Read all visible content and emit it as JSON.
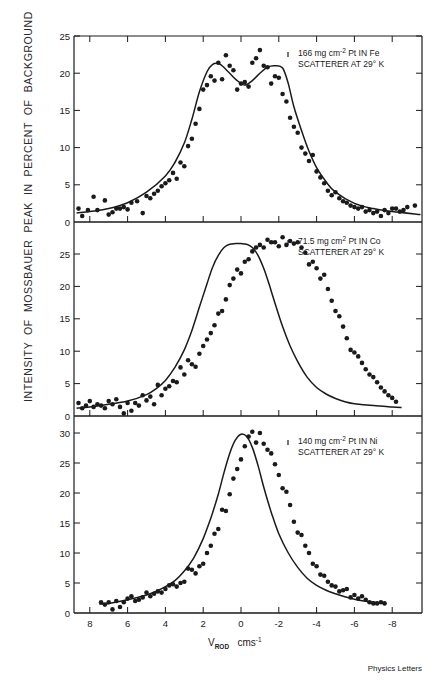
{
  "figure": {
    "ylabel": "INTENSITY  OF  MOSSBAUER  PEAK  IN  PERCENT  OF  BACKGROUND",
    "xlabel_main": "V",
    "xlabel_sub": "ROD",
    "xlabel_unit": "cms",
    "xlabel_unit_sup": "-1",
    "credit": "Physics Letters",
    "colors": {
      "ink": "#1a1a1a",
      "background": "#ffffff"
    }
  },
  "chart_data": [
    {
      "type": "scatter",
      "title": "166 mg cm-2 Pt IN Fe SCATTERER AT 29° K",
      "annotation_line1": "166  mg cm",
      "annotation_sup": "-2",
      "annotation_line1b": " Pt  IN  Fe",
      "annotation_line2": "SCATTERER  AT  29° K",
      "xlabel": "V_ROD cms^-1",
      "ylabel": "INTENSITY OF MOSSBAUER PEAK IN PERCENT OF BACKGROUND",
      "xlim": [
        8.8,
        -9.6
      ],
      "ylim": [
        0,
        25
      ],
      "yticks": [
        0,
        5,
        10,
        15,
        20,
        25
      ],
      "xticks": [
        8,
        6,
        4,
        2,
        0,
        -2,
        -4,
        -6,
        -8
      ],
      "grid": false,
      "fit_curve": {
        "x": [
          8.7,
          8,
          7,
          6,
          5,
          4,
          3.5,
          3,
          2.6,
          2.2,
          1.8,
          1.5,
          1.2,
          1.0,
          0.6,
          0.2,
          -0.2,
          -0.6,
          -1.0,
          -1.4,
          -1.8,
          -2.2,
          -2.5,
          -2.8,
          -3.2,
          -3.6,
          -4,
          -4.5,
          -5,
          -6,
          -7,
          -8,
          -9.5
        ],
        "y": [
          1.2,
          1.4,
          1.8,
          2.6,
          4.0,
          6.2,
          8.0,
          10.6,
          13.8,
          17.5,
          20.2,
          21.2,
          21.3,
          21.0,
          20.0,
          19.0,
          18.4,
          19.0,
          20.0,
          20.8,
          21.0,
          20.7,
          18.6,
          15.5,
          12.3,
          9.5,
          7.3,
          5.4,
          4.0,
          2.5,
          1.8,
          1.4,
          1.0
        ]
      },
      "series": [
        {
          "name": "measured",
          "x": [
            8.6,
            8.4,
            8.1,
            7.8,
            7.6,
            7.2,
            7.0,
            6.8,
            6.6,
            6.4,
            6.2,
            6.0,
            5.8,
            5.5,
            5.2,
            5.0,
            4.8,
            4.6,
            4.4,
            4.2,
            4.0,
            3.8,
            3.6,
            3.4,
            3.2,
            3.0,
            2.8,
            2.6,
            2.4,
            2.2,
            2.0,
            1.8,
            1.6,
            1.4,
            1.2,
            1.0,
            0.8,
            0.6,
            0.4,
            0.2,
            0.0,
            -0.2,
            -0.4,
            -0.6,
            -0.8,
            -1.0,
            -1.2,
            -1.4,
            -1.6,
            -1.8,
            -2.0,
            -2.2,
            -2.4,
            -2.6,
            -2.8,
            -3.0,
            -3.2,
            -3.4,
            -3.6,
            -3.8,
            -4.0,
            -4.2,
            -4.4,
            -4.6,
            -4.8,
            -5.0,
            -5.2,
            -5.4,
            -5.6,
            -5.8,
            -6.0,
            -6.2,
            -6.4,
            -6.6,
            -6.8,
            -7.0,
            -7.2,
            -7.4,
            -7.6,
            -7.8,
            -8.0,
            -8.2,
            -8.4,
            -8.6,
            -8.8,
            -9.2
          ],
          "y": [
            1.8,
            0.8,
            1.6,
            3.4,
            1.6,
            2.9,
            1.0,
            1.3,
            1.8,
            1.8,
            2.0,
            1.7,
            2.6,
            2.8,
            1.2,
            3.5,
            3.2,
            3.8,
            4.2,
            4.8,
            5.2,
            5.6,
            6.6,
            5.8,
            8.0,
            7.5,
            10.2,
            11.2,
            13.2,
            15.2,
            17.8,
            18.4,
            19.6,
            19.0,
            21.4,
            19.2,
            22.4,
            21.0,
            20.4,
            17.8,
            18.6,
            18.8,
            18.2,
            21.4,
            22.0,
            23.1,
            21.0,
            20.8,
            18.6,
            19.6,
            19.4,
            17.2,
            16.2,
            14.0,
            12.8,
            12.0,
            10.0,
            9.2,
            8.2,
            9.0,
            6.8,
            6.0,
            5.2,
            4.2,
            3.6,
            4.0,
            3.2,
            2.8,
            2.6,
            2.2,
            2.0,
            1.8,
            2.0,
            1.4,
            1.6,
            1.2,
            1.4,
            0.8,
            1.6,
            1.2,
            1.8,
            1.8,
            1.4,
            1.6,
            2.0,
            2.2
          ]
        }
      ]
    },
    {
      "type": "scatter",
      "title": "71.5 mg cm-2 Pt IN Co SCATTERER AT 29° K",
      "annotation_line1": "71.5  mg cm",
      "annotation_sup": "2",
      "annotation_line1b": "  Pt  IN  Co",
      "annotation_line2": "SCATTERER  AT  29° K",
      "xlim": [
        8.8,
        -9.6
      ],
      "ylim": [
        0,
        27.5
      ],
      "yticks": [
        0,
        5,
        10,
        15,
        20,
        25
      ],
      "xticks": [
        8,
        6,
        4,
        2,
        0,
        -2,
        -4,
        -6,
        -8
      ],
      "grid": false,
      "fit_curve": {
        "x": [
          8.7,
          8,
          7,
          6,
          5,
          4.5,
          4,
          3.5,
          3,
          2.6,
          2.2,
          1.8,
          1.5,
          1.2,
          0.9,
          0.6,
          0.3,
          0,
          -0.3,
          -0.6,
          -0.9,
          -1.2,
          -1.5,
          -1.8,
          -2.2,
          -2.6,
          -3,
          -3.5,
          -4,
          -4.5,
          -5,
          -5.5,
          -6,
          -7,
          -8,
          -8.5
        ],
        "y": [
          1.2,
          1.4,
          1.8,
          2.3,
          3.3,
          4.2,
          5.5,
          7.5,
          10.2,
          13.2,
          16.8,
          20.4,
          23.0,
          24.8,
          26.0,
          26.5,
          26.6,
          26.6,
          26.5,
          26.0,
          24.8,
          22.8,
          20.2,
          17.4,
          13.8,
          10.8,
          8.4,
          6.0,
          4.4,
          3.4,
          2.7,
          2.2,
          1.9,
          1.6,
          1.4,
          1.3
        ]
      },
      "series": [
        {
          "name": "measured",
          "x": [
            8.6,
            8.4,
            8.2,
            8.0,
            7.8,
            7.6,
            7.4,
            7.2,
            7.0,
            6.8,
            6.6,
            6.4,
            6.2,
            6.0,
            5.8,
            5.6,
            5.4,
            5.2,
            5.0,
            4.8,
            4.6,
            4.4,
            4.2,
            4.0,
            3.8,
            3.6,
            3.4,
            3.2,
            3.0,
            2.8,
            2.6,
            2.4,
            2.2,
            2.0,
            1.8,
            1.6,
            1.4,
            1.2,
            1.0,
            0.8,
            0.6,
            0.4,
            0.2,
            0.0,
            -0.2,
            -0.4,
            -0.6,
            -0.8,
            -1.0,
            -1.2,
            -1.4,
            -1.6,
            -1.8,
            -2.0,
            -2.2,
            -2.4,
            -2.6,
            -2.8,
            -3.0,
            -3.2,
            -3.4,
            -3.6,
            -3.8,
            -4.0,
            -4.2,
            -4.4,
            -4.6,
            -4.8,
            -5.0,
            -5.2,
            -5.4,
            -5.6,
            -5.8,
            -6.0,
            -6.2,
            -6.4,
            -6.6,
            -6.8,
            -7.0,
            -7.2,
            -7.4,
            -7.6,
            -7.8,
            -8.0,
            -8.2
          ],
          "y": [
            2.0,
            1.2,
            1.6,
            2.3,
            1.4,
            1.8,
            1.6,
            1.2,
            2.3,
            1.8,
            2.6,
            1.4,
            0.4,
            2.0,
            0.8,
            2.0,
            1.6,
            3.2,
            2.4,
            3.0,
            1.8,
            4.8,
            3.2,
            4.2,
            4.6,
            5.4,
            5.2,
            7.5,
            6.4,
            8.6,
            8.0,
            7.6,
            9.6,
            10.8,
            11.8,
            12.8,
            14.0,
            15.8,
            16.2,
            18.0,
            20.2,
            21.2,
            22.6,
            22.0,
            23.8,
            24.2,
            25.4,
            26.0,
            26.4,
            26.0,
            27.2,
            26.8,
            26.8,
            26.2,
            27.6,
            26.4,
            27.0,
            26.6,
            26.8,
            26.0,
            25.2,
            23.4,
            23.8,
            22.8,
            21.2,
            21.8,
            19.6,
            17.8,
            16.2,
            15.4,
            13.8,
            12.0,
            10.2,
            9.8,
            9.2,
            8.2,
            7.2,
            6.4,
            6.0,
            5.2,
            4.4,
            3.8,
            3.2,
            2.8,
            2.2
          ]
        }
      ]
    },
    {
      "type": "scatter",
      "title": "140 mg cm-2 Pt IN Ni SCATTERER AT 29° K",
      "annotation_line1": "140  mg cm",
      "annotation_sup": "-2",
      "annotation_line1b": "  Pt  IN  Ni",
      "annotation_line2": "SCATTERER  AT  29° K",
      "xlim": [
        8.8,
        -9.6
      ],
      "ylim": [
        0,
        30
      ],
      "yticks": [
        0,
        5,
        10,
        15,
        20,
        25,
        30
      ],
      "xticks": [
        8,
        6,
        4,
        2,
        0,
        -2,
        -4,
        -6,
        -8
      ],
      "xticklabels": [
        "8",
        "6",
        "4",
        "2",
        "0",
        "-2",
        "-4",
        "-6",
        "-8"
      ],
      "grid": false,
      "fit_curve": {
        "x": [
          7.5,
          7,
          6,
          5,
          4.5,
          4,
          3.5,
          3,
          2.5,
          2.0,
          1.6,
          1.2,
          0.9,
          0.6,
          0.3,
          0.0,
          -0.3,
          -0.6,
          -0.9,
          -1.2,
          -1.6,
          -2.0,
          -2.5,
          -3.0,
          -3.5,
          -4,
          -4.5,
          -5,
          -5.5,
          -6,
          -6.5,
          -7,
          -7.6
        ],
        "y": [
          1.5,
          1.6,
          2.2,
          3.0,
          3.6,
          4.4,
          5.4,
          7.0,
          9.2,
          12.4,
          15.8,
          19.8,
          23.4,
          26.6,
          28.8,
          29.8,
          29.4,
          27.6,
          24.6,
          21.0,
          16.8,
          13.2,
          10.0,
          7.6,
          5.8,
          4.6,
          3.8,
          3.2,
          2.7,
          2.3,
          2.0,
          1.8,
          1.6
        ]
      },
      "series": [
        {
          "name": "measured",
          "x": [
            7.4,
            7.2,
            7.0,
            6.8,
            6.6,
            6.4,
            6.2,
            6.0,
            5.8,
            5.6,
            5.4,
            5.2,
            5.0,
            4.8,
            4.6,
            4.4,
            4.2,
            4.0,
            3.8,
            3.6,
            3.4,
            3.2,
            3.0,
            2.8,
            2.6,
            2.4,
            2.2,
            2.0,
            1.8,
            1.6,
            1.4,
            1.2,
            1.0,
            0.8,
            0.6,
            0.4,
            0.2,
            0.0,
            -0.2,
            -0.4,
            -0.6,
            -0.8,
            -1.0,
            -1.2,
            -1.4,
            -1.6,
            -1.8,
            -2.0,
            -2.2,
            -2.4,
            -2.6,
            -2.8,
            -3.0,
            -3.2,
            -3.4,
            -3.6,
            -3.8,
            -4.0,
            -4.2,
            -4.4,
            -4.6,
            -4.8,
            -5.0,
            -5.2,
            -5.4,
            -5.6,
            -5.8,
            -6.0,
            -6.2,
            -6.4,
            -6.6,
            -6.8,
            -7.0,
            -7.2,
            -7.4,
            -7.6
          ],
          "y": [
            1.8,
            1.4,
            1.8,
            0.6,
            2.0,
            1.0,
            1.8,
            2.4,
            2.8,
            2.0,
            2.2,
            2.6,
            3.4,
            2.8,
            3.2,
            3.6,
            3.4,
            4.0,
            4.6,
            4.8,
            4.4,
            5.0,
            5.2,
            7.4,
            7.2,
            6.6,
            7.8,
            8.2,
            10.0,
            11.2,
            13.2,
            14.0,
            17.2,
            17.0,
            19.8,
            22.4,
            24.0,
            25.6,
            27.8,
            29.4,
            30.2,
            28.4,
            30.0,
            28.2,
            27.2,
            26.6,
            24.8,
            23.0,
            20.8,
            20.2,
            18.0,
            15.2,
            13.4,
            13.0,
            11.2,
            10.0,
            8.2,
            7.8,
            6.4,
            6.2,
            5.2,
            4.6,
            4.4,
            3.6,
            3.8,
            4.0,
            2.6,
            3.0,
            2.4,
            2.8,
            2.2,
            1.8,
            1.6,
            1.6,
            1.8,
            1.6
          ]
        }
      ]
    }
  ]
}
